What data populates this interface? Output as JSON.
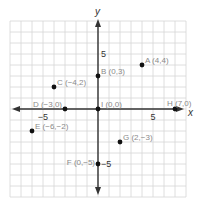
{
  "figure": {
    "title": "",
    "axes": {
      "x_label": "x",
      "y_label": "y",
      "x_tick_labels": [
        {
          "value": -5,
          "label": "−5"
        },
        {
          "value": 5,
          "label": "5"
        }
      ],
      "y_tick_labels": [
        {
          "value": 5,
          "label": "5"
        },
        {
          "value": -5,
          "label": "−5"
        }
      ],
      "grid_range": {
        "x": [
          -8,
          8
        ],
        "y": [
          -8,
          8
        ]
      },
      "unit_px": 11,
      "origin_px": [
        98,
        109
      ]
    },
    "points": [
      {
        "name": "A",
        "x": 4,
        "y": 4,
        "label": "A (4,4)"
      },
      {
        "name": "B",
        "x": 0,
        "y": 3,
        "label": "B (0,3)"
      },
      {
        "name": "C",
        "x": -4,
        "y": 2,
        "label": "C (−4,2)"
      },
      {
        "name": "D",
        "x": -3,
        "y": 0,
        "label": "D (−3,0)"
      },
      {
        "name": "I",
        "x": 0,
        "y": 0,
        "label": "I (0,0)"
      },
      {
        "name": "E",
        "x": -6,
        "y": -2,
        "label": "E (−6,−2)"
      },
      {
        "name": "F",
        "x": 0,
        "y": -5,
        "label": "F (0,−5)"
      },
      {
        "name": "G",
        "x": 2,
        "y": -3,
        "label": "G (2,−3)"
      },
      {
        "name": "H",
        "x": 7,
        "y": 0,
        "label": "H (7,0)"
      }
    ],
    "colors": {
      "grid": "#d6d6d6",
      "axis": "#333333",
      "point": "#111111",
      "label": "#8a8a8a",
      "tick": "#333333"
    }
  }
}
